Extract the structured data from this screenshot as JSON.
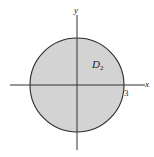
{
  "figure": {
    "type": "region-diagram",
    "axes": {
      "x_label": "x",
      "y_label": "y"
    },
    "region": {
      "label_main": "D",
      "label_sub": "2",
      "radius_label": "3",
      "fill_color": "#d3d3d3",
      "stroke_color": "#2a2a2a"
    },
    "axis_color": "#333333"
  }
}
